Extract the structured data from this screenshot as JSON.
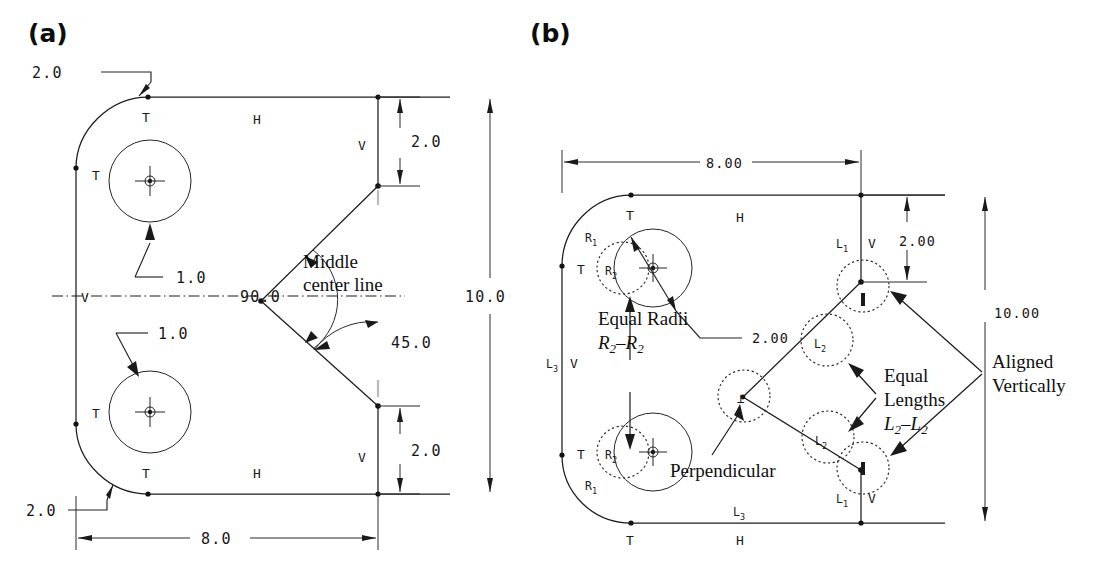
{
  "figure": {
    "type": "engineering-cad-constraint-drawing",
    "panels": [
      {
        "id": "a",
        "label": "(a)",
        "description": "Dimensioned part outline with explicit numeric dimensions and constraint tags",
        "dimensions": [
          {
            "name": "fillet-top-left",
            "value": "2.0"
          },
          {
            "name": "fillet-bottom-left",
            "value": "2.0"
          },
          {
            "name": "hole-top-radius",
            "value": "1.0"
          },
          {
            "name": "hole-bottom-radius",
            "value": "1.0"
          },
          {
            "name": "offset-top-right",
            "value": "2.0"
          },
          {
            "name": "offset-bottom-right",
            "value": "2.0"
          },
          {
            "name": "overall-height",
            "value": "10.0"
          },
          {
            "name": "overall-width",
            "value": "8.0"
          },
          {
            "name": "vertex-angle",
            "value": "90.0"
          },
          {
            "name": "chamfer-angle",
            "value": "45.0"
          }
        ],
        "constraint_tags": [
          {
            "name": "tangent-top-left",
            "label": "T"
          },
          {
            "name": "tangent-left-upper",
            "label": "T"
          },
          {
            "name": "tangent-left-lower",
            "label": "T"
          },
          {
            "name": "tangent-bottom-left",
            "label": "T"
          },
          {
            "name": "horizontal-top",
            "label": "H"
          },
          {
            "name": "horizontal-bottom",
            "label": "H"
          },
          {
            "name": "vertical-right-upper",
            "label": "V"
          },
          {
            "name": "vertical-right-lower",
            "label": "V"
          },
          {
            "name": "vertical-centerline",
            "label": "V"
          }
        ],
        "annotations": [
          {
            "name": "middle-center-line-note",
            "line1": "Middle",
            "line2": "center line"
          }
        ]
      },
      {
        "id": "b",
        "label": "(b)",
        "description": "Same part shown with symbolic/parametric constraints instead of repeated numbers",
        "dimensions": [
          {
            "name": "overall-width",
            "value": "8.00"
          },
          {
            "name": "offset-top-right",
            "value": "2.00"
          },
          {
            "name": "overall-height",
            "value": "10.00"
          },
          {
            "name": "hole-radius",
            "value": "2.00"
          }
        ],
        "constraint_tags": [
          {
            "name": "tangent-top-left",
            "label": "T"
          },
          {
            "name": "tangent-left-upper",
            "label": "T"
          },
          {
            "name": "tangent-left-lower",
            "label": "T"
          },
          {
            "name": "tangent-bottom-left",
            "label": "T"
          },
          {
            "name": "horizontal-top",
            "label": "H"
          },
          {
            "name": "horizontal-bottom",
            "label": "H"
          },
          {
            "name": "vertical-right-upper",
            "label": "V"
          },
          {
            "name": "vertical-right-lower",
            "label": "V"
          },
          {
            "name": "vertical-left-edge",
            "label": "V"
          }
        ],
        "parametric_labels": [
          {
            "name": "radius-fillet-upper",
            "base": "R",
            "sub": "1"
          },
          {
            "name": "radius-fillet-lower",
            "base": "R",
            "sub": "1"
          },
          {
            "name": "radius-hole-upper",
            "base": "R",
            "sub": "2"
          },
          {
            "name": "radius-hole-lower",
            "base": "R",
            "sub": "2"
          },
          {
            "name": "length-right-upper",
            "base": "L",
            "sub": "1"
          },
          {
            "name": "length-right-lower",
            "base": "L",
            "sub": "1"
          },
          {
            "name": "length-chamfer-upper",
            "base": "L",
            "sub": "2"
          },
          {
            "name": "length-chamfer-lower",
            "base": "L",
            "sub": "2"
          },
          {
            "name": "length-left-edge",
            "base": "L",
            "sub": "3"
          },
          {
            "name": "length-bottom-edge",
            "base": "L",
            "sub": "3"
          }
        ],
        "constraint_callouts": [
          {
            "name": "equal-radii-callout",
            "line1": "Equal Radii",
            "line2": "R",
            "sub1": "2",
            "dash": "–",
            "line3": "R",
            "sub2": "2"
          },
          {
            "name": "equal-lengths-callout",
            "line1": "Equal",
            "line2": "Lengths",
            "line3": "L",
            "sub1": "2",
            "dash": "–",
            "line4": "L",
            "sub2": "2"
          },
          {
            "name": "perpendicular-callout",
            "label": "Perpendicular",
            "symbol": "⊥"
          },
          {
            "name": "aligned-vertically-callout",
            "line1": "Aligned",
            "line2": "Vertically",
            "symbol": "|"
          }
        ]
      }
    ]
  },
  "colors": {
    "ink": "#1c1c1c",
    "paper": "#ffffff",
    "faint": "#b9b9b9"
  }
}
